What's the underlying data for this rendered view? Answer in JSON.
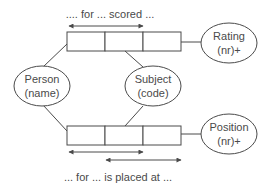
{
  "diagram": {
    "top_fact": {
      "caption": ".... for ... scored ...",
      "roles": 3
    },
    "bottom_fact": {
      "caption": "... for ... is placed at ...",
      "roles": 3
    },
    "objects": {
      "person": {
        "name": "Person",
        "ref": "(name)"
      },
      "subject": {
        "name": "Subject",
        "ref": "(code)"
      },
      "rating": {
        "name": "Rating",
        "ref": "(nr)+"
      },
      "position": {
        "name": "Position",
        "ref": "(nr)+"
      }
    },
    "colors": {
      "line": "#4a4a4a",
      "background": "#ffffff"
    }
  }
}
